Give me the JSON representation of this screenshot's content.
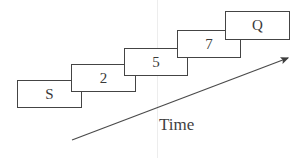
{
  "diagram": {
    "background_color": "#ffffff",
    "stroke_color": "#444444",
    "text_color": "#3a3a3a",
    "stages": [
      {
        "label": "S",
        "name": "stage-s",
        "x": 17,
        "y": 80,
        "width": 65,
        "height": 28,
        "font_size": 15,
        "z": 1
      },
      {
        "label": "2",
        "name": "stage-2",
        "x": 71,
        "y": 64,
        "width": 65,
        "height": 28,
        "font_size": 15,
        "z": 2
      },
      {
        "label": "5",
        "name": "stage-5",
        "x": 124,
        "y": 48,
        "width": 64,
        "height": 28,
        "font_size": 15,
        "z": 3
      },
      {
        "label": "7",
        "name": "stage-7",
        "x": 177,
        "y": 30,
        "width": 64,
        "height": 28,
        "font_size": 15,
        "z": 4
      },
      {
        "label": "Q",
        "name": "stage-q",
        "x": 225,
        "y": 11,
        "width": 65,
        "height": 29,
        "font_size": 15,
        "z": 5
      }
    ],
    "axis": {
      "caption": "Time",
      "caption_x": 159,
      "caption_y": 115,
      "caption_font_size": 17,
      "start_x": 72,
      "start_y": 140,
      "end_x": 288,
      "end_y": 58,
      "stroke_color": "#4a4a4a",
      "stroke_width": 1.2
    },
    "guide": {
      "x": 157,
      "color": "#ededed"
    }
  }
}
